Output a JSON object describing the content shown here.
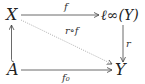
{
  "diagram": {
    "type": "commutative-diagram",
    "nodes": {
      "X": "X",
      "linf": "ℓ∞(Y)",
      "A": "A",
      "Y": "Y"
    },
    "edges": [
      {
        "id": "f",
        "from": "X",
        "to": "ℓ∞(Y)",
        "label": "f",
        "style": "solid"
      },
      {
        "id": "r",
        "from": "ℓ∞(Y)",
        "to": "Y",
        "label": "r",
        "style": "solid"
      },
      {
        "id": "f0",
        "from": "A",
        "to": "Y",
        "label": "f₀",
        "style": "solid"
      },
      {
        "id": "incl",
        "from": "A",
        "to": "X",
        "label": "",
        "style": "hook"
      },
      {
        "id": "rof",
        "from": "X",
        "to": "Y",
        "label": "r∘f",
        "style": "dotted"
      }
    ],
    "labels": {
      "f": "f",
      "r": "r",
      "f0": "f₀",
      "rof": "r∘f"
    },
    "colors": {
      "stroke": "#444444",
      "dotted": "#888888",
      "text": "#222222"
    }
  }
}
